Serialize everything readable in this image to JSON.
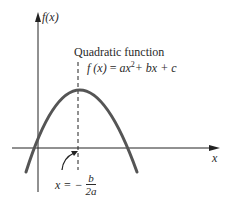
{
  "diagram": {
    "title": "Quadratic function",
    "equation": {
      "lhs": "f (x)",
      "eq": " = ",
      "a_term": "ax",
      "a_exp": "2",
      "rest": "+ bx + c"
    },
    "y_axis_label": "f(x)",
    "x_axis_label": "x",
    "vertex_annotation": {
      "prefix": "x = −",
      "numerator": "b",
      "denominator": "2a"
    },
    "curve": {
      "type": "downward parabola",
      "vertex_px": [
        78,
        90
      ],
      "roots_px": [
        33,
        126
      ]
    },
    "colors": {
      "curve": "#555555",
      "axes": "#222222",
      "text": "#2a2a2a",
      "background": "#ffffff"
    }
  }
}
